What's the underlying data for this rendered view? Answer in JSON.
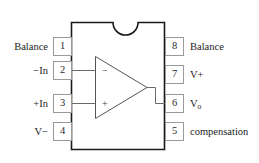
{
  "diagram": {
    "package": {
      "notch_label": "notch",
      "body_stroke": "#1a1a1a",
      "body_fill": "#ffffff"
    },
    "amplifier": {
      "inverting_sign": "−",
      "noninverting_sign": "+",
      "stroke": "#555555"
    },
    "pins_left": [
      {
        "number": "1",
        "label": "Balance",
        "sub": ""
      },
      {
        "number": "2",
        "label": "−In",
        "sub": ""
      },
      {
        "number": "3",
        "label": "+In",
        "sub": ""
      },
      {
        "number": "4",
        "label": "V−",
        "sub": ""
      }
    ],
    "pins_right": [
      {
        "number": "8",
        "label": "Balance",
        "sub": ""
      },
      {
        "number": "7",
        "label": "V+",
        "sub": ""
      },
      {
        "number": "6",
        "label": "V",
        "sub": "o"
      },
      {
        "number": "5",
        "label": "compensation",
        "sub": ""
      }
    ],
    "colors": {
      "pin_border": "#9a9a9a",
      "text": "#1c1c1c",
      "wire": "#6a6a6a"
    }
  }
}
